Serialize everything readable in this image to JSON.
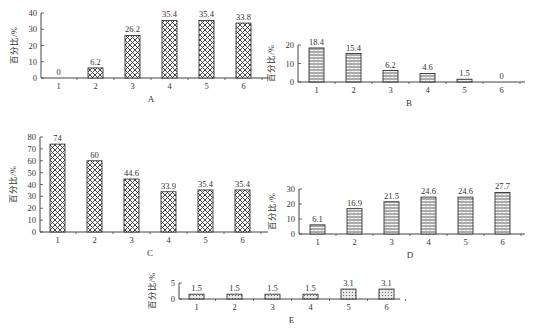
{
  "chart_data": [
    {
      "id": "A",
      "type": "bar",
      "title": "A",
      "xlabel": "A",
      "ylabel": "百分比/%",
      "categories": [
        "1",
        "2",
        "3",
        "4",
        "5",
        "6"
      ],
      "values": [
        0,
        6.2,
        26.2,
        35.4,
        35.4,
        33.8
      ],
      "value_labels": [
        "0",
        "6.2",
        "26.2",
        "35.4",
        "35.4",
        "33.8"
      ],
      "yticks": [
        0,
        10,
        20,
        30,
        40
      ],
      "ylim": [
        0,
        40
      ],
      "pattern": "crosshatch",
      "grid": false
    },
    {
      "id": "B",
      "type": "bar",
      "title": "B",
      "xlabel": "B",
      "ylabel": "百分比/%",
      "categories": [
        "1",
        "2",
        "3",
        "4",
        "5",
        "6"
      ],
      "values": [
        18.4,
        15.4,
        6.2,
        4.6,
        1.5,
        0
      ],
      "value_labels": [
        "18.4",
        "15.4",
        "6.2",
        "4.6",
        "1.5",
        "0"
      ],
      "yticks": [
        0,
        10,
        20
      ],
      "ylim": [
        0,
        20
      ],
      "pattern": "horizontal-lines",
      "grid": false
    },
    {
      "id": "C",
      "type": "bar",
      "title": "C",
      "xlabel": "C",
      "ylabel": "百分比/%",
      "categories": [
        "1",
        "2",
        "3",
        "4",
        "5",
        "6"
      ],
      "values": [
        74,
        60,
        44.6,
        33.9,
        35.4,
        35.4
      ],
      "value_labels": [
        "74",
        "60",
        "44.6",
        "33.9",
        "35.4",
        "35.4"
      ],
      "yticks": [
        0,
        10,
        20,
        30,
        40,
        50,
        60,
        70,
        80
      ],
      "ylim": [
        0,
        80
      ],
      "pattern": "crosshatch",
      "grid": false
    },
    {
      "id": "D",
      "type": "bar",
      "title": "D",
      "xlabel": "D",
      "ylabel": "百分比/%",
      "categories": [
        "1",
        "2",
        "3",
        "4",
        "5",
        "6"
      ],
      "values": [
        6.1,
        16.9,
        21.5,
        24.6,
        24.6,
        27.7
      ],
      "value_labels": [
        "6.1",
        "16.9",
        "21.5",
        "24.6",
        "24.6",
        "27.7"
      ],
      "yticks": [
        0,
        10,
        20,
        30
      ],
      "ylim": [
        0,
        30
      ],
      "pattern": "horizontal-lines",
      "grid": false
    },
    {
      "id": "E",
      "type": "bar",
      "title": "E",
      "xlabel": "E",
      "ylabel": "百分比/%",
      "categories": [
        "1",
        "2",
        "3",
        "4",
        "5",
        "6"
      ],
      "values": [
        1.5,
        1.5,
        1.5,
        1.5,
        3.1,
        3.1
      ],
      "value_labels": [
        "1.5",
        "1.5",
        "1.5",
        "1.5",
        "3.1",
        "3.1"
      ],
      "yticks": [
        0,
        5
      ],
      "ylim": [
        0,
        5
      ],
      "pattern": "dots",
      "grid": false
    }
  ],
  "layout": {
    "A": {
      "x0": 41,
      "y0": 78,
      "h": 65,
      "step": 37,
      "first": 51,
      "bw": 15,
      "xend": 268
    },
    "B": {
      "x0": 298,
      "y0": 82,
      "h": 37,
      "step": 37,
      "first": 309,
      "bw": 15,
      "xend": 525
    },
    "C": {
      "x0": 40,
      "y0": 232,
      "h": 95,
      "step": 37,
      "first": 50,
      "bw": 15,
      "xend": 268
    },
    "D": {
      "x0": 299,
      "y0": 234,
      "h": 45,
      "step": 37,
      "first": 310,
      "bw": 15,
      "xend": 525
    },
    "E": {
      "x0": 179,
      "y0": 299,
      "h": 16,
      "step": 38,
      "first": 189,
      "bw": 15,
      "xend": 400
    }
  },
  "colors": {
    "axis": "#444444",
    "bar_stroke": "#333333",
    "text": "#333333"
  }
}
